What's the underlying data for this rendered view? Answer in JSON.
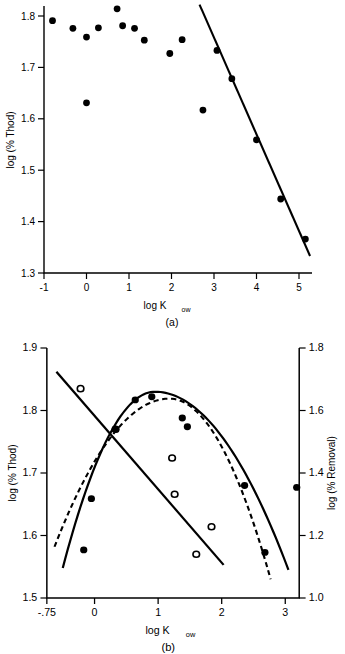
{
  "figure": {
    "panels": [
      {
        "id": "a",
        "caption": "(a)",
        "xlabel_main": "log K",
        "xlabel_sub": "ow",
        "ylabel": "log (% Thod)"
      },
      {
        "id": "b",
        "caption": "(b)",
        "xlabel_main": "log K",
        "xlabel_sub": "ow",
        "ylabel_left": "log (% Thod)",
        "ylabel_right": "log (% Removal)"
      }
    ]
  },
  "chart_data": [
    {
      "type": "scatter",
      "title": "(a)",
      "xlabel": "log Kow",
      "ylabel": "log (% Thod)",
      "xlim": [
        -1,
        5.3
      ],
      "ylim": [
        1.3,
        1.83
      ],
      "xticks": [
        -1,
        0,
        1,
        2,
        3,
        4,
        5
      ],
      "xtick_labels": [
        "-1",
        "0",
        "1",
        "2",
        "3",
        "4",
        "5"
      ],
      "yticks": [
        1.3,
        1.4,
        1.5,
        1.6,
        1.7,
        1.8
      ],
      "ytick_labels": [
        "1.3",
        "1.4",
        "1.5",
        "1.6",
        "1.7",
        "1.8"
      ],
      "grid": false,
      "legend": "none",
      "series": [
        {
          "name": "log (% Thod) vs log Kow",
          "marker": "filled-circle",
          "points": [
            {
              "x": -0.8,
              "y": 1.791
            },
            {
              "x": -0.32,
              "y": 1.776
            },
            {
              "x": 0.0,
              "y": 1.759
            },
            {
              "x": 0.0,
              "y": 1.631
            },
            {
              "x": 0.28,
              "y": 1.777
            },
            {
              "x": 0.72,
              "y": 1.814
            },
            {
              "x": 0.85,
              "y": 1.781
            },
            {
              "x": 1.13,
              "y": 1.776
            },
            {
              "x": 1.36,
              "y": 1.753
            },
            {
              "x": 1.96,
              "y": 1.727
            },
            {
              "x": 2.25,
              "y": 1.754
            },
            {
              "x": 2.74,
              "y": 1.617
            },
            {
              "x": 3.07,
              "y": 1.733
            },
            {
              "x": 3.42,
              "y": 1.678
            },
            {
              "x": 4.0,
              "y": 1.559
            },
            {
              "x": 4.57,
              "y": 1.444
            },
            {
              "x": 5.15,
              "y": 1.366
            }
          ]
        }
      ],
      "fit_lines": [
        {
          "name": "regression-line",
          "style": "solid",
          "x0": 2.66,
          "y0": 1.822,
          "x1": 5.26,
          "y1": 1.333
        }
      ]
    },
    {
      "type": "scatter",
      "title": "(b)",
      "xlabel": "log Kow",
      "ylabel_left": "log (% Thod)",
      "ylabel_right": "log (% Removal)",
      "xlim": [
        -0.75,
        3.22
      ],
      "ylim_left": [
        1.5,
        1.9
      ],
      "ylim_right": [
        1.0,
        1.8
      ],
      "xticks": [
        -0.75,
        0,
        1,
        2,
        3
      ],
      "xtick_labels": [
        "-.75",
        "0",
        "1",
        "2",
        "3"
      ],
      "yticks_left": [
        1.5,
        1.6,
        1.7,
        1.8,
        1.9
      ],
      "ytick_labels_left": [
        "1.5",
        "1.6",
        "1.7",
        "1.8",
        "1.9"
      ],
      "yticks_right": [
        1.0,
        1.2,
        1.4,
        1.6,
        1.8
      ],
      "ytick_labels_right": [
        "1.0",
        "1.2",
        "1.4",
        "1.6",
        "1.8"
      ],
      "grid": false,
      "legend": "none",
      "series": [
        {
          "name": "log (% Thod) - open circles (descending)",
          "marker": "open-circle",
          "axis": "left",
          "points": [
            {
              "x": -0.22,
              "y": 1.835
            },
            {
              "x": 0.33,
              "y": 1.77
            },
            {
              "x": 1.22,
              "y": 1.724
            },
            {
              "x": 1.26,
              "y": 1.666
            },
            {
              "x": 1.84,
              "y": 1.614
            },
            {
              "x": 1.6,
              "y": 1.57
            }
          ]
        },
        {
          "name": "log (% Removal) - filled circles (parabolic)",
          "marker": "filled-circle",
          "axis": "right",
          "points": [
            {
              "x": -0.17,
              "y": 1.577
            },
            {
              "x": -0.05,
              "y": 1.659
            },
            {
              "x": 0.33,
              "y": 1.77
            },
            {
              "x": 0.64,
              "y": 1.817
            },
            {
              "x": 0.9,
              "y": 1.822
            },
            {
              "x": 1.38,
              "y": 1.788
            },
            {
              "x": 1.46,
              "y": 1.774
            },
            {
              "x": 2.36,
              "y": 1.68
            },
            {
              "x": 2.68,
              "y": 1.573
            },
            {
              "x": 3.18,
              "y": 1.677
            }
          ]
        }
      ],
      "fit_lines": [
        {
          "name": "descending-regression-line",
          "style": "solid",
          "x0": -0.6,
          "y0": 1.862,
          "x1": 2.03,
          "y1": 1.553
        }
      ],
      "fit_curves": [
        {
          "name": "solid-parabola",
          "style": "solid",
          "vertex_x": 0.95,
          "vertex_y": 1.83,
          "x_start": -0.5,
          "x_end": 3.05,
          "y_start": 1.548,
          "y_end": 1.545
        },
        {
          "name": "dashed-parabola",
          "style": "dashed",
          "vertex_x": 1.18,
          "vertex_y": 1.819,
          "x_start": -0.63,
          "x_end": 2.77,
          "y_start": 1.582,
          "y_end": 1.53
        }
      ]
    }
  ]
}
